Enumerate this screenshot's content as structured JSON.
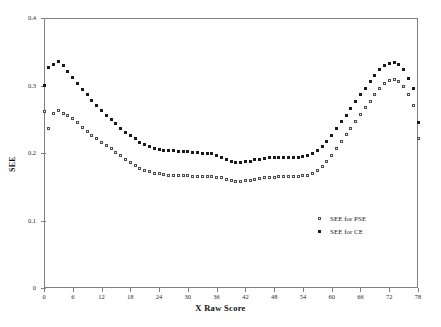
{
  "chart_data": {
    "type": "scatter",
    "title": "",
    "xlabel": "X Raw Score",
    "ylabel": "SEE",
    "xlim": [
      0,
      78
    ],
    "ylim": [
      0,
      0.4
    ],
    "xticks": [
      0,
      6,
      12,
      18,
      24,
      30,
      36,
      42,
      48,
      54,
      60,
      66,
      72,
      78
    ],
    "yticks": [
      0,
      0.1,
      0.2,
      0.3,
      0.4
    ],
    "ytick_labels": [
      "0",
      "0.1",
      "0.2",
      "0.3",
      "0.4"
    ],
    "grid": false,
    "legend_position": "lower-right",
    "x": [
      0,
      1,
      2,
      3,
      4,
      5,
      6,
      7,
      8,
      9,
      10,
      11,
      12,
      13,
      14,
      15,
      16,
      17,
      18,
      19,
      20,
      21,
      22,
      23,
      24,
      25,
      26,
      27,
      28,
      29,
      30,
      31,
      32,
      33,
      34,
      35,
      36,
      37,
      38,
      39,
      40,
      41,
      42,
      43,
      44,
      45,
      46,
      47,
      48,
      49,
      50,
      51,
      52,
      53,
      54,
      55,
      56,
      57,
      58,
      59,
      60,
      61,
      62,
      63,
      64,
      65,
      66,
      67,
      68,
      69,
      70,
      71,
      72,
      73,
      74,
      75,
      76,
      77,
      78
    ],
    "series": [
      {
        "name": "SEE for PSE",
        "marker": "open-square",
        "color": "#4d4d4d",
        "values": [
          0.262,
          0.236,
          0.258,
          0.263,
          0.259,
          0.255,
          0.251,
          0.245,
          0.238,
          0.232,
          0.226,
          0.221,
          0.216,
          0.211,
          0.206,
          0.201,
          0.196,
          0.191,
          0.186,
          0.181,
          0.177,
          0.174,
          0.172,
          0.17,
          0.169,
          0.168,
          0.167,
          0.167,
          0.166,
          0.166,
          0.166,
          0.165,
          0.165,
          0.165,
          0.165,
          0.165,
          0.164,
          0.163,
          0.161,
          0.159,
          0.158,
          0.158,
          0.159,
          0.16,
          0.161,
          0.162,
          0.163,
          0.164,
          0.164,
          0.165,
          0.165,
          0.165,
          0.165,
          0.165,
          0.166,
          0.167,
          0.17,
          0.174,
          0.18,
          0.188,
          0.197,
          0.207,
          0.217,
          0.227,
          0.237,
          0.247,
          0.257,
          0.267,
          0.277,
          0.287,
          0.296,
          0.303,
          0.308,
          0.309,
          0.306,
          0.298,
          0.286,
          0.271,
          0.222
        ]
      },
      {
        "name": "SEE for CE",
        "marker": "filled-square",
        "color": "#1a1a1a",
        "values": [
          0.3,
          0.326,
          0.331,
          0.336,
          0.329,
          0.321,
          0.312,
          0.303,
          0.294,
          0.286,
          0.278,
          0.27,
          0.263,
          0.256,
          0.249,
          0.243,
          0.237,
          0.231,
          0.226,
          0.221,
          0.216,
          0.212,
          0.209,
          0.207,
          0.205,
          0.204,
          0.203,
          0.203,
          0.202,
          0.202,
          0.202,
          0.201,
          0.201,
          0.2,
          0.2,
          0.199,
          0.197,
          0.194,
          0.191,
          0.188,
          0.186,
          0.186,
          0.187,
          0.188,
          0.19,
          0.191,
          0.192,
          0.193,
          0.194,
          0.194,
          0.194,
          0.194,
          0.194,
          0.194,
          0.195,
          0.196,
          0.199,
          0.203,
          0.209,
          0.217,
          0.226,
          0.236,
          0.246,
          0.256,
          0.266,
          0.276,
          0.286,
          0.296,
          0.306,
          0.315,
          0.323,
          0.329,
          0.333,
          0.334,
          0.331,
          0.323,
          0.311,
          0.296,
          0.245
        ]
      }
    ]
  },
  "legend": {
    "items": [
      {
        "label": "SEE for PSE",
        "marker": "open-square"
      },
      {
        "label": "SEE for CE",
        "marker": "filled-square"
      }
    ]
  },
  "axes": {
    "x_axis_title": "X Raw Score",
    "y_axis_title": "SEE"
  }
}
